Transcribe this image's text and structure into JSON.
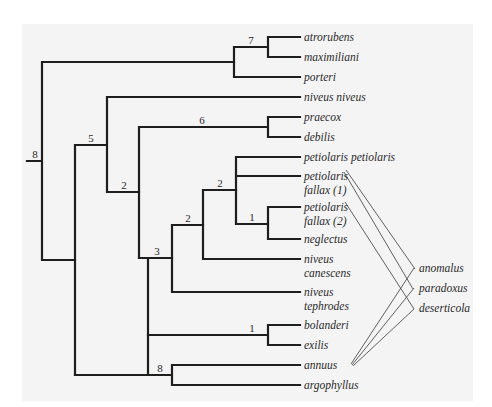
{
  "figure": {
    "type": "phylogenetic-tree",
    "background": "#f4f4f4",
    "line_color": "#1e1e1e"
  },
  "taxa": [
    {
      "id": "atrorubens",
      "lines": [
        "atrorubens"
      ]
    },
    {
      "id": "maximiliani",
      "lines": [
        "maximiliani"
      ]
    },
    {
      "id": "porteri",
      "lines": [
        "porteri"
      ]
    },
    {
      "id": "niveus_niveus",
      "lines": [
        "niveus niveus"
      ]
    },
    {
      "id": "praecox",
      "lines": [
        "praecox"
      ]
    },
    {
      "id": "debilis",
      "lines": [
        "debilis"
      ]
    },
    {
      "id": "petiolaris_petiolaris",
      "lines": [
        "petiolaris petiolaris"
      ]
    },
    {
      "id": "petiolaris_fallax_1",
      "lines": [
        "petiolaris",
        "fallax (1)"
      ]
    },
    {
      "id": "petiolaris_fallax_2",
      "lines": [
        "petiolaris",
        "fallax (2)"
      ]
    },
    {
      "id": "neglectus",
      "lines": [
        "neglectus"
      ]
    },
    {
      "id": "niveus_canescens",
      "lines": [
        "niveus",
        "canescens"
      ]
    },
    {
      "id": "niveus_tephrodes",
      "lines": [
        "niveus",
        "tephrodes"
      ]
    },
    {
      "id": "bolanderi",
      "lines": [
        "bolanderi"
      ]
    },
    {
      "id": "exilis",
      "lines": [
        "exilis"
      ]
    },
    {
      "id": "annuus",
      "lines": [
        "annuus"
      ]
    },
    {
      "id": "argophyllus",
      "lines": [
        "argophyllus"
      ]
    }
  ],
  "support_values": {
    "root": "8",
    "atrorubens_clade": "7",
    "node_5": "5",
    "node_2a": "2",
    "praecox_debilis": "6",
    "petiolaris_inner": "2",
    "petiolaris_outer": "2",
    "fallax2_neglectus": "1",
    "node_3": "3",
    "bolanderi_exilis": "1",
    "annuus_argophyllus": "8"
  },
  "hybrids": {
    "labels": [
      "anomalus",
      "paradoxus",
      "deserticola"
    ],
    "parentage": [
      {
        "hybrid": "anomalus",
        "parents": [
          "petiolaris fallax (1)",
          "annuus"
        ]
      },
      {
        "hybrid": "paradoxus",
        "parents": [
          "petiolaris fallax (1)",
          "annuus"
        ]
      },
      {
        "hybrid": "deserticola",
        "parents": [
          "petiolaris fallax (2)",
          "annuus"
        ]
      }
    ]
  }
}
